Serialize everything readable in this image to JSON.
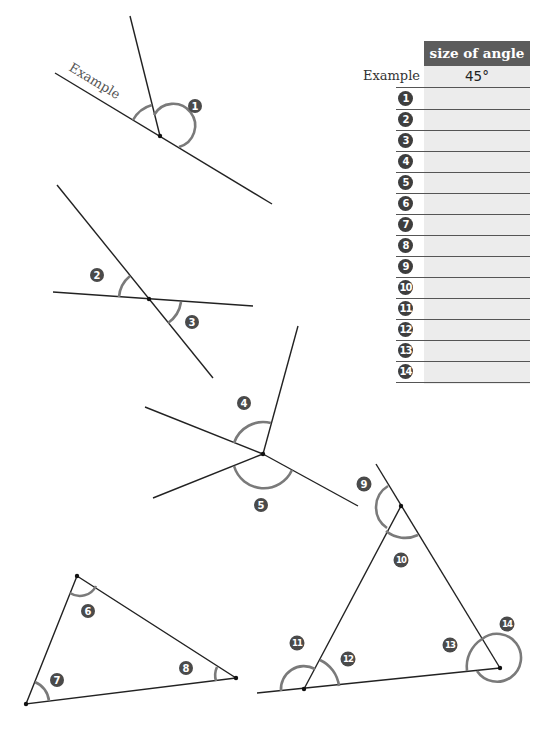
{
  "worksheet": {
    "example_label": "Example",
    "table": {
      "header": "size of angle",
      "rows": [
        {
          "label": "Example",
          "value": "45°"
        },
        {
          "label": "1",
          "value": ""
        },
        {
          "label": "2",
          "value": ""
        },
        {
          "label": "3",
          "value": ""
        },
        {
          "label": "4",
          "value": ""
        },
        {
          "label": "5",
          "value": ""
        },
        {
          "label": "6",
          "value": ""
        },
        {
          "label": "7",
          "value": ""
        },
        {
          "label": "8",
          "value": ""
        },
        {
          "label": "9",
          "value": ""
        },
        {
          "label": "10",
          "value": ""
        },
        {
          "label": "11",
          "value": ""
        },
        {
          "label": "12",
          "value": ""
        },
        {
          "label": "13",
          "value": ""
        },
        {
          "label": "14",
          "value": ""
        }
      ]
    },
    "angle_badges": [
      "1",
      "2",
      "3",
      "4",
      "5",
      "6",
      "7",
      "8",
      "9",
      "10",
      "11",
      "12",
      "13",
      "14"
    ],
    "colors": {
      "header_bg": "#5c5c5c",
      "answer_column_bg": "#ececec",
      "arc": "#7a7a7a",
      "badge": "#4a4a4a",
      "line": "#222222"
    }
  }
}
